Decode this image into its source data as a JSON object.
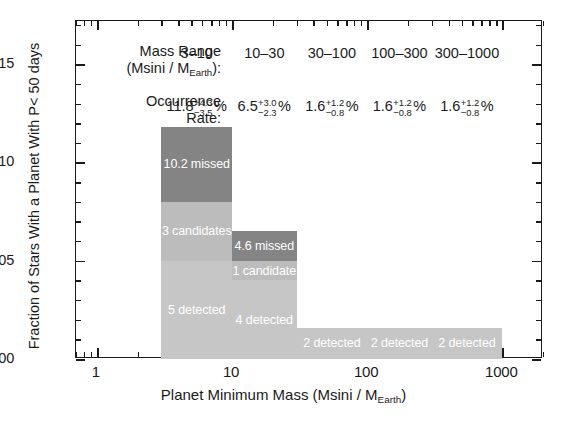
{
  "chart_data": {
    "type": "bar",
    "title": "",
    "xlabel": "Planet Minimum Mass  (Msini / M_Earth)",
    "ylabel": "Fraction of Stars With a Planet With P< 50 days",
    "xscale": "log",
    "xlim": [
      0.7,
      2000
    ],
    "ylim": [
      0.0,
      0.172
    ],
    "grid": false,
    "legend": "none",
    "y_ticks": [
      "0.00",
      "0.05",
      "0.10",
      "0.15"
    ],
    "y_tick_values": [
      0.0,
      0.05,
      0.1,
      0.15
    ],
    "x_ticks": [
      "1",
      "10",
      "100",
      "1000"
    ],
    "x_tick_values": [
      1,
      10,
      100,
      1000
    ],
    "categories": [
      "3-10",
      "10-30",
      "30-100",
      "100-300",
      "300-1000"
    ],
    "totals": [
      0.118,
      0.065,
      0.016,
      0.016,
      0.016
    ],
    "series": [
      {
        "name": "detected",
        "values": [
          0.05,
          0.04,
          0.016,
          0.016,
          0.016
        ]
      },
      {
        "name": "candidates",
        "values": [
          0.03,
          0.01,
          0.0,
          0.0,
          0.0
        ]
      },
      {
        "name": "missed",
        "values": [
          0.038,
          0.015,
          0.0,
          0.0,
          0.0
        ]
      }
    ],
    "bars": [
      {
        "range": "3-10",
        "x_start": 3,
        "x_end": 10,
        "total": 0.118,
        "segments": [
          {
            "kind": "missed",
            "label": "10.2 missed",
            "value": 0.038,
            "color": "#848484"
          },
          {
            "kind": "candidates",
            "label": "3 candidates",
            "value": 0.03,
            "color": "#bcbcbc"
          },
          {
            "kind": "detected",
            "label": "5 detected",
            "value": 0.05,
            "color": "#c6c6c6"
          }
        ]
      },
      {
        "range": "10-30",
        "x_start": 10,
        "x_end": 30,
        "total": 0.065,
        "segments": [
          {
            "kind": "missed",
            "label": "4.6 missed",
            "value": 0.015,
            "color": "#848484"
          },
          {
            "kind": "candidates",
            "label": "1 candidate",
            "value": 0.01,
            "color": "#bcbcbc"
          },
          {
            "kind": "detected",
            "label": "4 detected",
            "value": 0.04,
            "color": "#c6c6c6"
          }
        ]
      },
      {
        "range": "30-100",
        "x_start": 30,
        "x_end": 100,
        "total": 0.016,
        "segments": [
          {
            "kind": "detected",
            "label": "2 detected",
            "value": 0.016,
            "color": "#c6c6c6"
          }
        ]
      },
      {
        "range": "100-300",
        "x_start": 100,
        "x_end": 300,
        "total": 0.016,
        "segments": [
          {
            "kind": "detected",
            "label": "2 detected",
            "value": 0.016,
            "color": "#c6c6c6"
          }
        ]
      },
      {
        "range": "300-1000",
        "x_start": 300,
        "x_end": 1000,
        "total": 0.016,
        "segments": [
          {
            "kind": "detected",
            "label": "2 detected",
            "value": 0.016,
            "color": "#c6c6c6"
          }
        ]
      }
    ],
    "annotations": {
      "mass_range_row_label_line1": "Mass Range",
      "mass_range_row_label_line2_prefix": "(Msini / M",
      "mass_range_row_label_line2_sub": "Earth",
      "mass_range_row_label_line2_suffix": "):",
      "occurrence_row_label_line1": "Occurrence",
      "occurrence_row_label_line2": "Rate:",
      "mass_ranges": [
        "3–10",
        "10–30",
        "30–100",
        "100–300",
        "300–1000"
      ],
      "occurrence_rates": [
        {
          "value": "11.8",
          "hi": "+4.3",
          "lo": "−3.5",
          "unit": "%"
        },
        {
          "value": "6.5",
          "hi": "+3.0",
          "lo": "−2.3",
          "unit": "%"
        },
        {
          "value": "1.6",
          "hi": "+1.2",
          "lo": "−0.8",
          "unit": "%"
        },
        {
          "value": "1.6",
          "hi": "+1.2",
          "lo": "−0.8",
          "unit": "%"
        },
        {
          "value": "1.6",
          "hi": "+1.2",
          "lo": "−0.8",
          "unit": "%"
        }
      ]
    },
    "colors": {
      "missed": "#848484",
      "candidates": "#bcbcbc",
      "detected": "#c6c6c6",
      "axis": "#1a1a1a",
      "background": "#ffffff",
      "seg_label_text": "#ffffff"
    }
  },
  "axis": {
    "x_title_prefix": "Planet Minimum Mass  (Msini / M",
    "x_title_sub": "Earth",
    "x_title_suffix": ")",
    "y_title": "Fraction of Stars With a Planet With P< 50 days"
  }
}
